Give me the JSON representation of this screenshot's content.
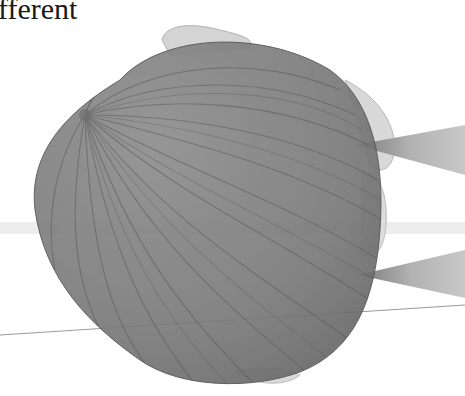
{
  "caption": {
    "text": "fferent"
  },
  "illustration": {
    "subject": "top-down view of a head with hair, two ears and two sound cones",
    "elements": [
      "head-top-view",
      "left-ear",
      "right-ear",
      "upper-sound-cone",
      "lower-sound-cone",
      "horizontal-guide-band",
      "diagonal-guide-line"
    ],
    "colors": {
      "background": "#ffffff",
      "hair": "#7d7d7d",
      "hair_dark": "#5e5e5e",
      "ear": "#dadada",
      "cone": "#a6a6a6",
      "band": "#e6e6e6",
      "line": "#9a9a9a",
      "text": "#1a1a1a"
    }
  }
}
